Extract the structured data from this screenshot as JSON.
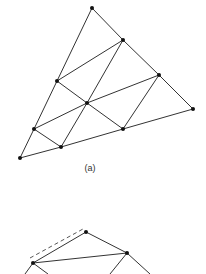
{
  "figures": [
    {
      "id": "a",
      "caption": "(a)",
      "caption_pos": [
        90,
        168
      ],
      "nodes": [
        [
          92,
          8
        ],
        [
          123,
          40
        ],
        [
          57,
          81
        ],
        [
          159,
          75
        ],
        [
          87,
          103
        ],
        [
          193,
          109
        ],
        [
          34,
          129
        ],
        [
          123,
          129
        ],
        [
          61,
          147
        ],
        [
          20,
          158
        ]
      ],
      "edges": [
        [
          0,
          1
        ],
        [
          1,
          3
        ],
        [
          3,
          5
        ],
        [
          0,
          2
        ],
        [
          2,
          6
        ],
        [
          6,
          9
        ],
        [
          9,
          8
        ],
        [
          8,
          7
        ],
        [
          7,
          5
        ],
        [
          2,
          1
        ],
        [
          6,
          4
        ],
        [
          4,
          3
        ],
        [
          2,
          4
        ],
        [
          4,
          7
        ],
        [
          6,
          8
        ],
        [
          1,
          4
        ],
        [
          4,
          8
        ],
        [
          3,
          7
        ]
      ],
      "dashed_edges": []
    },
    {
      "id": "b",
      "caption": "",
      "nodes": [
        [
          86,
          232
        ],
        [
          127,
          253
        ],
        [
          33,
          263
        ]
      ],
      "edges": [
        [
          0,
          1
        ],
        [
          0,
          2
        ],
        [
          2,
          1
        ]
      ],
      "open_edges": [
        [
          [
            127,
            253
          ],
          [
            150,
            274
          ]
        ],
        [
          [
            127,
            253
          ],
          [
            110,
            274
          ]
        ],
        [
          [
            33,
            263
          ],
          [
            48,
            274
          ]
        ],
        [
          [
            33,
            263
          ],
          [
            25,
            274
          ]
        ]
      ],
      "dashed_edges": [
        [
          [
            30,
            258
          ],
          [
            83,
            229
          ]
        ]
      ]
    }
  ],
  "style": {
    "line_color": "#333333",
    "node_color": "#111111",
    "dash_color": "#555555"
  }
}
